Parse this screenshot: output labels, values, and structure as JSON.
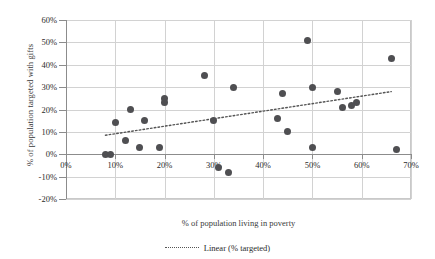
{
  "chart_data": {
    "type": "scatter",
    "title": "",
    "xlabel": "% of population living in poverty",
    "ylabel": "% of population targeted with gifts",
    "xlim": [
      0,
      70
    ],
    "ylim": [
      -20,
      60
    ],
    "xticks": [
      "0%",
      "10%",
      "20%",
      "30%",
      "40%",
      "50%",
      "60%",
      "70%"
    ],
    "xtick_values": [
      0,
      10,
      20,
      30,
      40,
      50,
      60,
      70
    ],
    "yticks": [
      "-20%",
      "-10%",
      "0%",
      "10%",
      "20%",
      "30%",
      "40%",
      "50%",
      "60%"
    ],
    "ytick_values": [
      -20,
      -10,
      0,
      10,
      20,
      30,
      40,
      50,
      60
    ],
    "grid": true,
    "legend_position": "bottom",
    "series": [
      {
        "name": "% targeted",
        "marker": "circle",
        "color": "#4f4f52",
        "points": [
          {
            "x": 8,
            "y": 0
          },
          {
            "x": 9,
            "y": 0
          },
          {
            "x": 10,
            "y": 14
          },
          {
            "x": 12,
            "y": 6
          },
          {
            "x": 13,
            "y": 20
          },
          {
            "x": 15,
            "y": 3
          },
          {
            "x": 16,
            "y": 15
          },
          {
            "x": 19,
            "y": 3
          },
          {
            "x": 20,
            "y": 25
          },
          {
            "x": 20,
            "y": 23
          },
          {
            "x": 28,
            "y": 35
          },
          {
            "x": 30,
            "y": 15
          },
          {
            "x": 31,
            "y": -6
          },
          {
            "x": 33,
            "y": -8
          },
          {
            "x": 34,
            "y": 30
          },
          {
            "x": 43,
            "y": 16
          },
          {
            "x": 44,
            "y": 27
          },
          {
            "x": 45,
            "y": 10
          },
          {
            "x": 49,
            "y": 51
          },
          {
            "x": 50,
            "y": 30
          },
          {
            "x": 50,
            "y": 3
          },
          {
            "x": 55,
            "y": 28
          },
          {
            "x": 56,
            "y": 21
          },
          {
            "x": 58,
            "y": 22
          },
          {
            "x": 59,
            "y": 23
          },
          {
            "x": 66,
            "y": 43
          },
          {
            "x": 67,
            "y": 2
          }
        ]
      }
    ],
    "trendline": {
      "label": "Linear (% targeted)",
      "style": "dotted",
      "color": "#555555",
      "x_start": 8,
      "y_start": 8.5,
      "x_end": 66,
      "y_end": 28
    }
  },
  "legend": {
    "entries": [
      {
        "label": "Linear (% targeted)",
        "marker": "dotted-line"
      }
    ]
  }
}
